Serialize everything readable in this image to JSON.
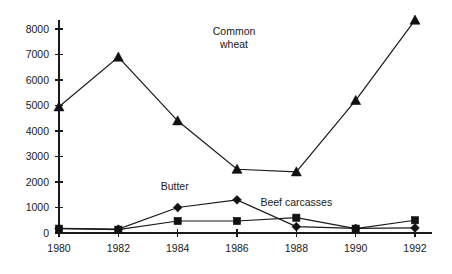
{
  "chart_data": {
    "type": "line",
    "title": "",
    "subtitle": "",
    "xlabel": "",
    "ylabel": "",
    "x": [
      1980,
      1982,
      1984,
      1986,
      1988,
      1990,
      1992
    ],
    "categories": [
      "1980",
      "1982",
      "1984",
      "1986",
      "1988",
      "1990",
      "1992"
    ],
    "xlim": [
      1980,
      1992
    ],
    "ylim": [
      0,
      8000
    ],
    "yticks": [
      0,
      1000,
      2000,
      3000,
      4000,
      5000,
      6000,
      7000,
      8000
    ],
    "yticklabels": [
      "0",
      "1000",
      "2000",
      "3000",
      "4000",
      "5000",
      "6000",
      "7000",
      "8000"
    ],
    "xticks": [
      1980,
      1982,
      1984,
      1986,
      1988,
      1990,
      1992
    ],
    "xticklabels": [
      "1980",
      "1982",
      "1984",
      "1986",
      "1988",
      "1990",
      "1992"
    ],
    "grid": false,
    "legend": "inline-annotations",
    "series": [
      {
        "name": "Common wheat",
        "marker": "triangle",
        "color": "#111111",
        "values": [
          4950,
          6900,
          4400,
          2500,
          2400,
          5200,
          8350
        ]
      },
      {
        "name": "Butter",
        "marker": "diamond",
        "color": "#111111",
        "values": [
          180,
          150,
          1000,
          1300,
          250,
          180,
          200
        ]
      },
      {
        "name": "Beef carcasses",
        "marker": "square",
        "color": "#111111",
        "values": [
          170,
          130,
          470,
          470,
          600,
          170,
          500
        ]
      }
    ],
    "annotations": [
      {
        "name": "common-wheat-label",
        "text": "Common",
        "text2": "wheat",
        "x": 1985.9,
        "y": 7750
      },
      {
        "name": "butter-label",
        "text": "Butter",
        "x": 1983.9,
        "y": 1700
      },
      {
        "name": "beef-carcasses-label",
        "text": "Beef carcasses",
        "x": 1988.0,
        "y": 1050
      }
    ]
  },
  "labels": {
    "common_wheat_line1": "Common",
    "common_wheat_line2": "wheat",
    "butter": "Butter",
    "beef_carcasses": "Beef carcasses"
  },
  "colors": {
    "background": "#ffffff",
    "ink": "#1a1a1a",
    "marker": "#111111"
  }
}
